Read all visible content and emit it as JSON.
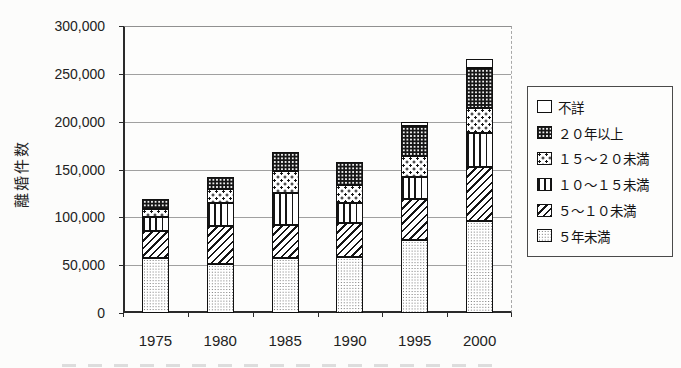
{
  "chart_data": {
    "type": "bar",
    "stacked": true,
    "title": "",
    "xlabel": "",
    "ylabel": "離婚件数",
    "ylim": [
      0,
      300000
    ],
    "ytick_interval": 50000,
    "ytick_labels_top_to_bottom": [
      "300,000",
      "250,000",
      "200,000",
      "150,000",
      "100,000",
      "50,000",
      "0"
    ],
    "grid": true,
    "legend_position": "right",
    "categories": [
      "1975",
      "1980",
      "1985",
      "1990",
      "1995",
      "2000"
    ],
    "series": [
      {
        "name": "５年未満",
        "pattern": "fine-dots",
        "values": [
          58000,
          51000,
          58000,
          59000,
          76000,
          96000
        ]
      },
      {
        "name": "５～１０未満",
        "pattern": "diagonal-hatch",
        "values": [
          28000,
          40000,
          34000,
          35000,
          43000,
          57000
        ]
      },
      {
        "name": "１０～１５未満",
        "pattern": "vertical-stripes",
        "values": [
          14000,
          24000,
          33000,
          21000,
          23000,
          35000
        ]
      },
      {
        "name": "１５～２０未満",
        "pattern": "sparse-dots",
        "values": [
          9000,
          15000,
          23000,
          19000,
          22000,
          26000
        ]
      },
      {
        "name": "２０年以上",
        "pattern": "black-dotted",
        "values": [
          10000,
          12000,
          20000,
          24000,
          31000,
          42000
        ]
      },
      {
        "name": "不詳",
        "pattern": "plain-white",
        "values": [
          0,
          0,
          0,
          0,
          5000,
          9000
        ]
      }
    ],
    "totals": [
      119000,
      142000,
      168000,
      158000,
      200000,
      265000
    ],
    "legend_top_to_bottom": [
      "不詳",
      "２０年以上",
      "１５～２０未満",
      "１０～１５未満",
      "５～１０未満",
      "５年未満"
    ]
  },
  "colors": {
    "ink": "#1a1a1a",
    "grid": "#a0a0a0",
    "axis": "#2a2a2a",
    "legend_border": "#4a4a4a"
  }
}
